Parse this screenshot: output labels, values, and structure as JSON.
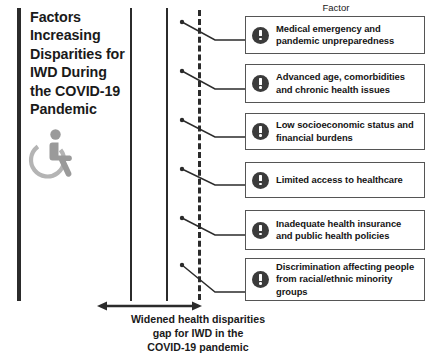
{
  "title": {
    "text": "Factors\nIncreasing\nDisparities for\nIWD During\nthe COVID-19\nPandemic",
    "icon": "wheelchair-accessibility-icon"
  },
  "header": {
    "column_label": "Factor"
  },
  "factors": [
    {
      "icon": "alert-exclamation-icon",
      "text": "Medical emergency and pandemic unpreparedness"
    },
    {
      "icon": "alert-exclamation-icon",
      "text": "Advanced age, comorbidities and chronic health issues"
    },
    {
      "icon": "alert-exclamation-icon",
      "text": "Low socioeconomic status and financial burdens"
    },
    {
      "icon": "alert-exclamation-icon",
      "text": "Limited access to healthcare"
    },
    {
      "icon": "alert-exclamation-icon",
      "text": "Inadequate health insurance and public health policies"
    },
    {
      "icon": "alert-exclamation-icon",
      "text": "Discrimination affecting people from racial/ethnic minority groups"
    }
  ],
  "caption": {
    "text": "Widened health disparities\ngap for IWD in the\nCOVID-19 pandemic",
    "arrow": "double-headed-horizontal-arrow"
  },
  "colors": {
    "line": "#2b2b2b",
    "box_border": "#555555",
    "icon_fill": "#3b3b3b",
    "wheelchair": "#a8a8a8",
    "text": "#1a1a1a",
    "background": "#ffffff"
  }
}
